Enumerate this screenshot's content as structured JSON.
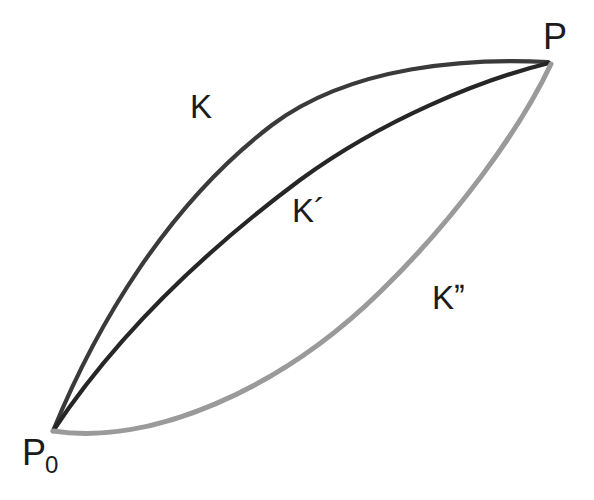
{
  "figure": {
    "background_color": "#ffffff",
    "width": 594,
    "height": 500
  },
  "points": {
    "start": {
      "name": "P0",
      "base": "P",
      "subscript": "0",
      "x": 53,
      "y": 431,
      "label_x": 22,
      "label_y": 435
    },
    "end": {
      "name": "P",
      "base": "P",
      "subscript": "",
      "x": 550,
      "y": 62,
      "label_x": 543,
      "label_y": 19
    }
  },
  "curves": [
    {
      "id": "K",
      "label": "K",
      "color": "#3a3a3a",
      "width": 4.2,
      "label_x": 190,
      "label_y": 90,
      "path": "M 53 431 C 96 326 167 205 272 125 C 352 65 470 58 548 62",
      "samples": [
        {
          "x": 53,
          "y": 431
        },
        {
          "x": 100,
          "y": 285
        },
        {
          "x": 150,
          "y": 218
        },
        {
          "x": 200,
          "y": 165
        },
        {
          "x": 250,
          "y": 130
        },
        {
          "x": 300,
          "y": 103
        },
        {
          "x": 380,
          "y": 80
        },
        {
          "x": 460,
          "y": 67
        },
        {
          "x": 550,
          "y": 62
        }
      ]
    },
    {
      "id": "Kprime",
      "label": "K´",
      "color": "#262626",
      "width": 4.2,
      "label_x": 292,
      "label_y": 194,
      "path": "M 53 431 C 110 345 190 262 300 180 C 382 120 480 80 549 63",
      "samples": [
        {
          "x": 53,
          "y": 431
        },
        {
          "x": 103,
          "y": 352
        },
        {
          "x": 150,
          "y": 298
        },
        {
          "x": 200,
          "y": 250
        },
        {
          "x": 250,
          "y": 210
        },
        {
          "x": 300,
          "y": 175
        },
        {
          "x": 350,
          "y": 146
        },
        {
          "x": 400,
          "y": 120
        },
        {
          "x": 470,
          "y": 93
        },
        {
          "x": 550,
          "y": 62
        }
      ]
    },
    {
      "id": "Kdoubleprime",
      "label": "Kˮ",
      "color": "#9a9a9a",
      "width": 5.0,
      "label_x": 432,
      "label_y": 281,
      "path": "M 53 431 C 150 446 280 390 380 292 C 455 219 520 130 551 64",
      "samples": [
        {
          "x": 53,
          "y": 431
        },
        {
          "x": 150,
          "y": 435
        },
        {
          "x": 250,
          "y": 393
        },
        {
          "x": 290,
          "y": 377
        },
        {
          "x": 330,
          "y": 350
        },
        {
          "x": 370,
          "y": 305
        },
        {
          "x": 410,
          "y": 260
        },
        {
          "x": 450,
          "y": 215
        },
        {
          "x": 480,
          "y": 180
        },
        {
          "x": 515,
          "y": 123
        },
        {
          "x": 550,
          "y": 62
        }
      ]
    }
  ]
}
